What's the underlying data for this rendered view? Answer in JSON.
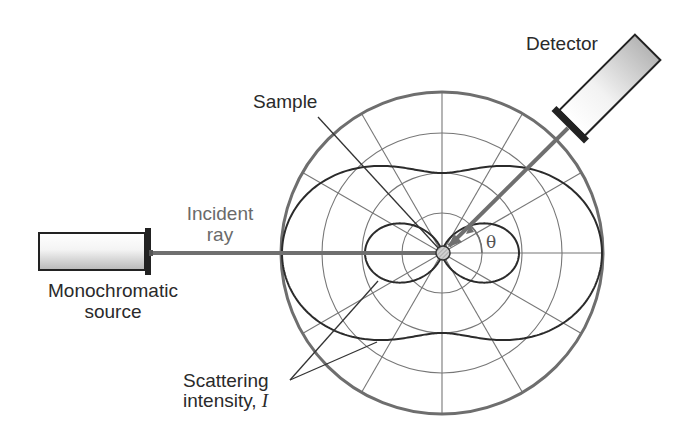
{
  "diagram": {
    "labels": {
      "detector": "Detector",
      "sample": "Sample",
      "incident_line1": "Incident",
      "incident_line2": "ray",
      "source_line1": "Monochromatic",
      "source_line2": "source",
      "scattering_line1": "Scattering",
      "scattering_line2": "intensity,",
      "intensity_symbol": "I",
      "angle_symbol": "θ"
    },
    "geometry": {
      "center": [
        442,
        253
      ],
      "grid_circle_radii": [
        40,
        80,
        120
      ],
      "outer_circle_radius": 161,
      "radial_line_step_deg": 30,
      "detector_angle_deg": 45
    },
    "curves": [
      {
        "name": "total-scattering",
        "formula": "1 + cos^2(theta)",
        "max_radius": 160
      },
      {
        "name": "parallel-component",
        "formula": "cos^2(theta)",
        "max_radius": 77
      }
    ],
    "colors": {
      "grid": "#777777",
      "outer_circle": "#6e6e6e",
      "curve": "#2b2b2b",
      "beam": "#6f6f6f",
      "label": "#2a2a2a",
      "incident_label": "#6a6a6a"
    }
  }
}
